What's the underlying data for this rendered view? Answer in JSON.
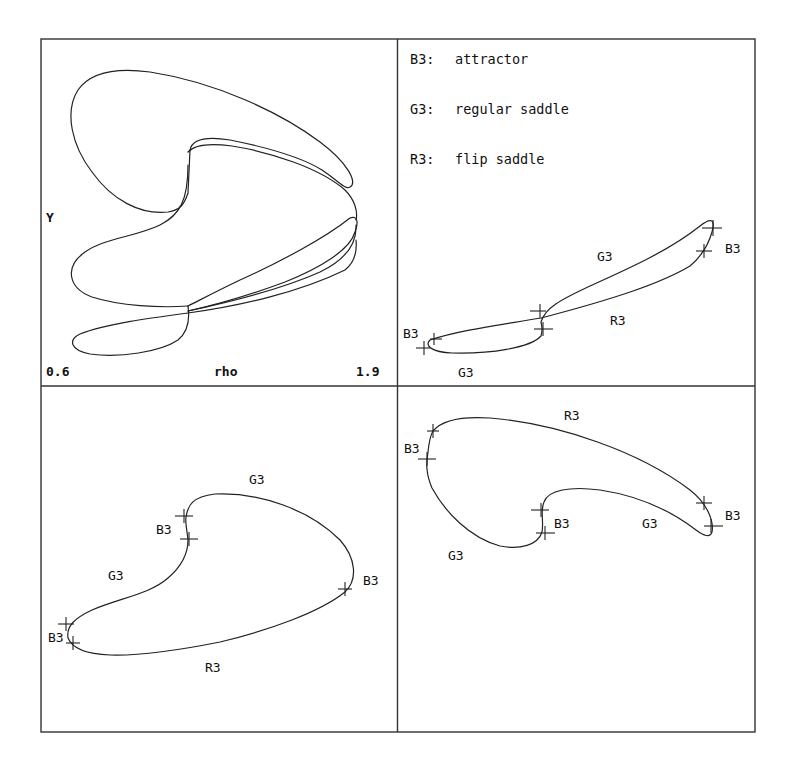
{
  "figure": {
    "background": "#ffffff",
    "line_color": "#222222",
    "layout": "2x2 panel grid"
  },
  "panels": {
    "top_left": {
      "description": "bifurcation diagram in (rho, Y) plane",
      "x_axis": {
        "label": "rho",
        "min": "0.6",
        "max": "1.9"
      },
      "y_axis": {
        "label": "Y"
      }
    },
    "top_right": {
      "legend": [
        {
          "code": "B3:",
          "meaning": "attractor"
        },
        {
          "code": "G3:",
          "meaning": "regular saddle"
        },
        {
          "code": "R3:",
          "meaning": "flip saddle"
        }
      ],
      "labels": [
        "G3",
        "B3",
        "R3",
        "B3",
        "G3"
      ]
    },
    "bottom_left": {
      "labels": [
        "G3",
        "B3",
        "G3",
        "B3",
        "B3",
        "R3"
      ]
    },
    "bottom_right": {
      "labels": [
        "R3",
        "B3",
        "B3",
        "G3",
        "B3",
        "G3"
      ]
    }
  }
}
